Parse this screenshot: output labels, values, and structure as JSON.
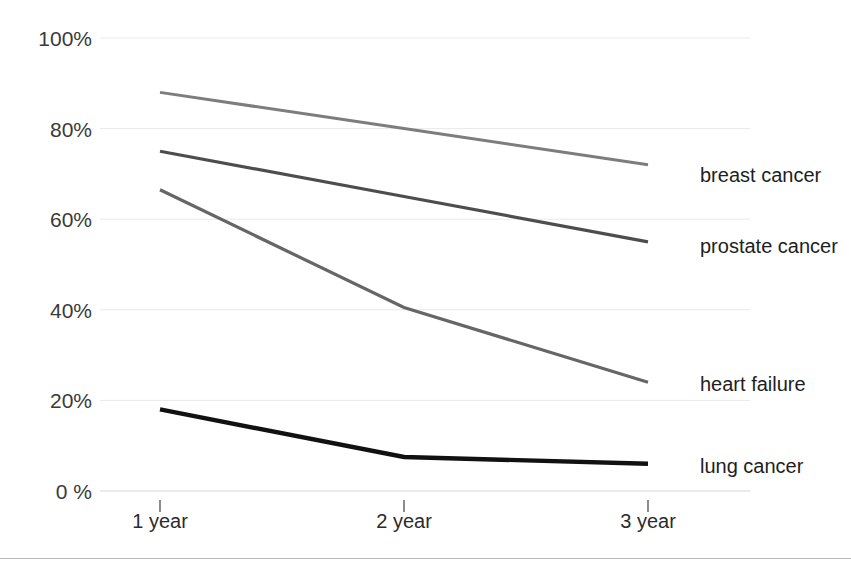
{
  "chart_data": {
    "type": "line",
    "title": "",
    "subtitle": "",
    "xlabel": "",
    "ylabel": "",
    "categories": [
      "1 year",
      "2 year",
      "3 year"
    ],
    "x_tick_labels": [
      "1 year",
      "2 year",
      "3 year"
    ],
    "y_tick_labels": [
      "0 %",
      "20%",
      "40%",
      "60%",
      "80%",
      "100%"
    ],
    "y_tick_values": [
      0,
      20,
      40,
      60,
      80,
      100
    ],
    "ylim": [
      0,
      100
    ],
    "y_unit": "%",
    "grid": "horizontal",
    "legend_position": "right-inline-end-of-line",
    "series": [
      {
        "name": "breast cancer",
        "label": "breast cancer",
        "values": [
          88,
          80,
          72
        ],
        "color": "#7d7d7d",
        "width": 3
      },
      {
        "name": "prostate cancer",
        "label": "prostate cancer",
        "values": [
          75,
          65,
          55
        ],
        "color": "#4d4d4d",
        "width": 3.2
      },
      {
        "name": "heart failure",
        "label": "heart failure",
        "values": [
          66.5,
          40.5,
          24
        ],
        "color": "#666666",
        "width": 3.2
      },
      {
        "name": "lung cancer",
        "label": "lung cancer",
        "values": [
          18,
          7.5,
          6
        ],
        "color": "#111111",
        "width": 4.4
      }
    ]
  },
  "axis": {
    "gridline_color": "#e9e9e9",
    "tick_color": "#6f6f6f",
    "baseline_color": "#d5d5d5"
  },
  "footer": {
    "rule_color": "#b9b9b9"
  }
}
